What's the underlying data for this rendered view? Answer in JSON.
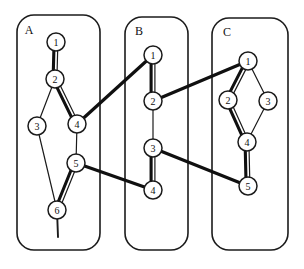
{
  "figure": {
    "type": "graph-diagram",
    "width": 304,
    "height": 269,
    "background_color": "#ffffff",
    "stroke_color": "#1b1b1b"
  },
  "panels": [
    {
      "id": "A",
      "label": "A",
      "label_pos": {
        "x": 29,
        "y": 31
      },
      "box": {
        "x": 17,
        "y": 15,
        "width": 83,
        "height": 235,
        "rx": 17
      },
      "nodes": [
        {
          "id": "A1",
          "label": "1",
          "x": 56,
          "y": 42,
          "r": 9
        },
        {
          "id": "A2",
          "label": "2",
          "x": 55,
          "y": 79,
          "r": 9
        },
        {
          "id": "A3",
          "label": "3",
          "x": 37,
          "y": 126,
          "r": 9
        },
        {
          "id": "A4",
          "label": "4",
          "x": 77,
          "y": 124,
          "r": 9
        },
        {
          "id": "A5",
          "label": "5",
          "x": 76,
          "y": 163,
          "r": 9
        },
        {
          "id": "A6",
          "label": "6",
          "x": 57,
          "y": 210,
          "r": 9
        }
      ],
      "edges": [
        {
          "from": "A1",
          "to": "A2",
          "weight": "double"
        },
        {
          "from": "A2",
          "to": "A3",
          "weight": "thin"
        },
        {
          "from": "A2",
          "to": "A4",
          "weight": "double"
        },
        {
          "from": "A3",
          "to": "A6",
          "weight": "thin"
        },
        {
          "from": "A4",
          "to": "A5",
          "weight": "thin"
        },
        {
          "from": "A5",
          "to": "A6",
          "weight": "double"
        }
      ],
      "tail": {
        "from": "A6",
        "to": {
          "x": 58,
          "y": 237
        }
      }
    },
    {
      "id": "B",
      "label": "B",
      "label_pos": {
        "x": 139,
        "y": 32
      },
      "box": {
        "x": 125,
        "y": 17,
        "width": 63,
        "height": 233,
        "rx": 17
      },
      "nodes": [
        {
          "id": "B1",
          "label": "1",
          "x": 153,
          "y": 55,
          "r": 9
        },
        {
          "id": "B2",
          "label": "2",
          "x": 153,
          "y": 101,
          "r": 9
        },
        {
          "id": "B3",
          "label": "3",
          "x": 153,
          "y": 148,
          "r": 9
        },
        {
          "id": "B4",
          "label": "4",
          "x": 153,
          "y": 190,
          "r": 9
        }
      ],
      "edges": [
        {
          "from": "B1",
          "to": "B2",
          "weight": "double"
        },
        {
          "from": "B2",
          "to": "B3",
          "weight": "thin"
        },
        {
          "from": "B3",
          "to": "B4",
          "weight": "double"
        }
      ]
    },
    {
      "id": "C",
      "label": "C",
      "label_pos": {
        "x": 227,
        "y": 33
      },
      "box": {
        "x": 212,
        "y": 18,
        "width": 76,
        "height": 232,
        "rx": 17
      },
      "nodes": [
        {
          "id": "C1",
          "label": "1",
          "x": 248,
          "y": 61,
          "r": 9
        },
        {
          "id": "C2",
          "label": "2",
          "x": 228,
          "y": 100,
          "r": 9
        },
        {
          "id": "C3",
          "label": "3",
          "x": 268,
          "y": 101,
          "r": 9
        },
        {
          "id": "C4",
          "label": "4",
          "x": 247,
          "y": 142,
          "r": 9
        },
        {
          "id": "C5",
          "label": "5",
          "x": 248,
          "y": 186,
          "r": 9
        }
      ],
      "edges": [
        {
          "from": "C1",
          "to": "C2",
          "weight": "double"
        },
        {
          "from": "C1",
          "to": "C3",
          "weight": "thin"
        },
        {
          "from": "C2",
          "to": "C4",
          "weight": "double"
        },
        {
          "from": "C3",
          "to": "C4",
          "weight": "thin"
        },
        {
          "from": "C4",
          "to": "C5",
          "weight": "double"
        }
      ]
    }
  ],
  "cross_links": [
    {
      "id": "link-a4-b1",
      "from": "A4",
      "to": "B1",
      "x1": 77,
      "y1": 124,
      "x2": 153,
      "y2": 55
    },
    {
      "id": "link-a5-b4",
      "from": "A5",
      "to": "B4",
      "x1": 76,
      "y1": 163,
      "x2": 153,
      "y2": 190
    },
    {
      "id": "link-b2-c1",
      "from": "B2",
      "to": "C1",
      "x1": 153,
      "y1": 101,
      "x2": 248,
      "y2": 61
    },
    {
      "id": "link-b3-c5",
      "from": "B3",
      "to": "C5",
      "x1": 153,
      "y1": 148,
      "x2": 248,
      "y2": 186
    }
  ]
}
